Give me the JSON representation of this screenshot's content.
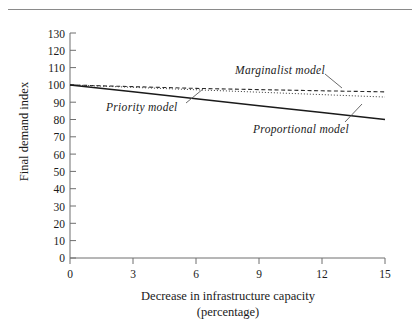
{
  "chart_data": {
    "type": "line",
    "title": "",
    "xlabel": "Decrease in infrastructure capacity (percentage)",
    "xlabel_line1": "Decrease in infrastructure capacity",
    "xlabel_line2": "(percentage)",
    "ylabel": "Final demand index",
    "xlim": [
      0,
      15
    ],
    "ylim": [
      0,
      130
    ],
    "grid": false,
    "legend_position": "inline-annotations",
    "xticks": [
      "0",
      "3",
      "6",
      "9",
      "12",
      "15"
    ],
    "yticks": [
      "0",
      "10",
      "20",
      "30",
      "40",
      "50",
      "60",
      "70",
      "80",
      "90",
      "100",
      "110",
      "120",
      "130"
    ],
    "x": [
      0,
      3,
      6,
      9,
      12,
      15
    ],
    "series": [
      {
        "name": "Marginalist model",
        "style": "dashed",
        "values": [
          100,
          99,
          98,
          97.3,
          96.6,
          96
        ]
      },
      {
        "name": "Priority model",
        "style": "dotted",
        "values": [
          100,
          98.6,
          97.2,
          95.8,
          94.4,
          93
        ]
      },
      {
        "name": "Proportional model",
        "style": "solid",
        "values": [
          100,
          96,
          92,
          88,
          84,
          80
        ]
      }
    ],
    "annotations": [
      {
        "label": "Marginalist model"
      },
      {
        "label": "Priority model"
      },
      {
        "label": "Proportional model"
      }
    ]
  }
}
